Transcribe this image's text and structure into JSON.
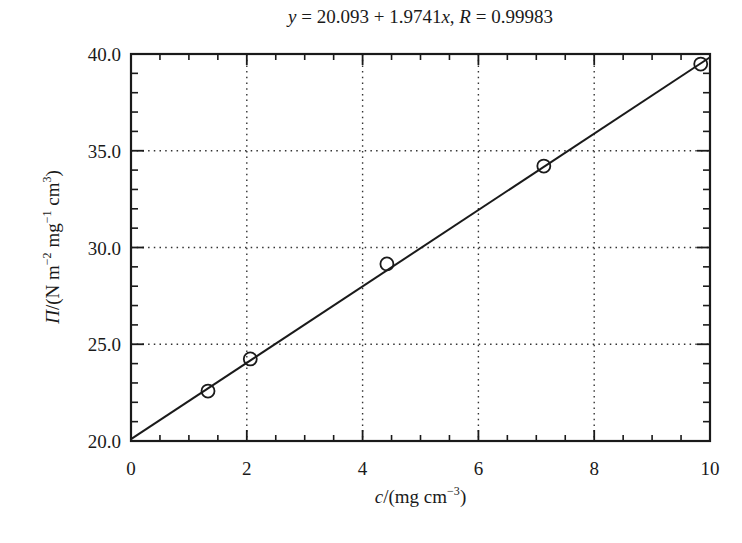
{
  "chart_data": {
    "type": "scatter",
    "title": "y = 20.093 + 1.9741x,  R = 0.99983",
    "fit": {
      "equation": "y = 20.093 + 1.9741x",
      "intercept": 20.093,
      "slope": 1.9741,
      "R": 0.99983,
      "x_range": [
        0,
        10
      ]
    },
    "xlabel": "c/(mg cm^-3)",
    "ylabel": "Π/(N m^-2 mg^-1 cm^3)",
    "xlim": [
      0,
      10
    ],
    "ylim": [
      20.0,
      40.0
    ],
    "x_ticks": [
      "0",
      "2",
      "4",
      "6",
      "8",
      "10"
    ],
    "y_ticks": [
      "20.0",
      "25.0",
      "30.0",
      "35.0",
      "40.0"
    ],
    "x_minor_step": 0.5,
    "y_minor_step": 1.0,
    "grid": true,
    "grid_style": "dotted",
    "legend": null,
    "series": [
      {
        "name": "data",
        "marker": "open-circle",
        "x": [
          1.33,
          2.06,
          4.42,
          7.13,
          9.84
        ],
        "y": [
          22.58,
          24.24,
          29.15,
          34.21,
          39.48
        ]
      },
      {
        "name": "linear fit",
        "marker": "line",
        "x": [
          0,
          10
        ],
        "y": [
          20.093,
          39.834
        ]
      }
    ]
  },
  "labels": {
    "title_y": "y",
    "title_eq": " = 20.093 + 1.9741",
    "title_x": "x",
    "title_sep": ",  ",
    "title_R": "R",
    "title_Rval": " = 0.99983",
    "x_var": "c",
    "x_unit_open": "/(mg cm",
    "x_exp": "−3",
    "x_unit_close": ")",
    "y_var": "Π",
    "y_unit_a": "/(N m",
    "y_exp_a": "−2",
    "y_unit_b": " mg",
    "y_exp_b": "−1",
    "y_unit_c": " cm",
    "y_exp_c": "3",
    "y_unit_close": ")"
  },
  "style": {
    "ink": "#1a1a1a",
    "grid": "#333333",
    "background": "#ffffff"
  }
}
